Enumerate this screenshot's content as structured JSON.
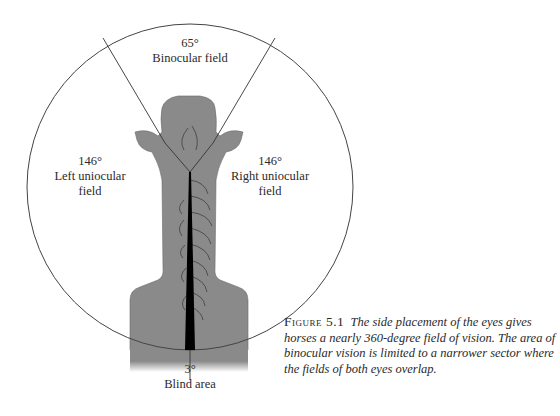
{
  "diagram": {
    "binocular": {
      "angle": "65°",
      "label": "Binocular field"
    },
    "left": {
      "angle": "146°",
      "label_line1": "Left uniocular",
      "label_line2": "field"
    },
    "right": {
      "angle": "146°",
      "label_line1": "Right uniocular",
      "label_line2": "field"
    },
    "blind": {
      "angle": "3°",
      "label": "Blind area"
    },
    "colors": {
      "horse": "#8a8a8a",
      "outline": "#3a3a3a",
      "blind_strip": "#000000",
      "circle": "#444444"
    }
  },
  "caption": {
    "figure_number": "Figure 5.1",
    "text": "The side placement of the eyes gives horses a nearly 360-degree field of vision. The area of binocular vision is limited to a narrower sector where the fields of both eyes overlap."
  }
}
